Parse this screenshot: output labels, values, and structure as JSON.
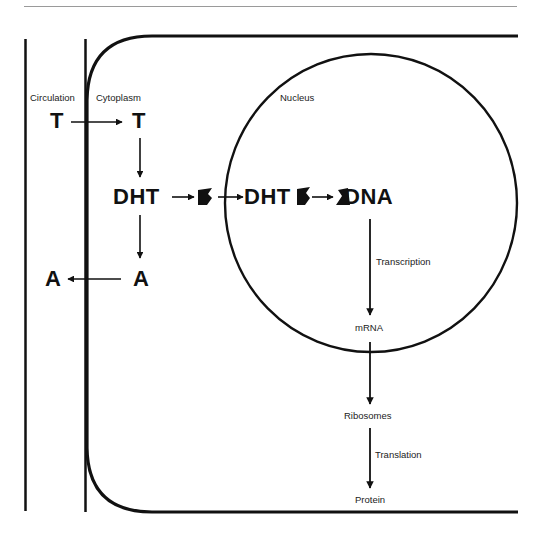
{
  "diagram": {
    "regions": {
      "circulation": "Circulation",
      "cytoplasm": "Cytoplasm",
      "nucleus": "Nucleus"
    },
    "molecules": {
      "t_circulation": "T",
      "t_cytoplasm": "T",
      "dht_cytoplasm": "DHT",
      "dht_nucleus": "DHT",
      "dna": "DNA",
      "a_cytoplasm": "A",
      "a_circulation": "A"
    },
    "steps": {
      "transcription": "Transcription",
      "mrna": "mRNA",
      "ribosomes": "Ribosomes",
      "translation": "Translation",
      "protein": "Protein"
    },
    "colors": {
      "line": "#111111",
      "rule": "#999999",
      "background": "#ffffff"
    },
    "flows": [
      {
        "from": "T (circulation)",
        "to": "T (cytoplasm)"
      },
      {
        "from": "T (cytoplasm)",
        "to": "DHT"
      },
      {
        "from": "DHT",
        "to": "receptor"
      },
      {
        "from": "DHT-receptor",
        "to": "nucleus DHT-receptor"
      },
      {
        "from": "DHT-receptor",
        "to": "DNA"
      },
      {
        "from": "DNA",
        "to": "mRNA",
        "label": "Transcription"
      },
      {
        "from": "mRNA",
        "to": "Ribosomes"
      },
      {
        "from": "Ribosomes",
        "to": "Protein",
        "label": "Translation"
      },
      {
        "from": "DHT",
        "to": "A (cytoplasm)"
      },
      {
        "from": "A (cytoplasm)",
        "to": "A (circulation)"
      }
    ]
  }
}
